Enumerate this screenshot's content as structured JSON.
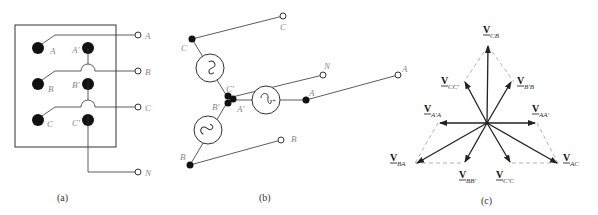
{
  "panel_a": {
    "caption": "(a)",
    "inner_labels": [
      "A",
      "A'",
      "B",
      "B'",
      "C",
      "C'"
    ],
    "terminal_labels": [
      "A",
      "B",
      "C",
      "N"
    ]
  },
  "panel_b": {
    "caption": "(b)",
    "node_labels": [
      "C",
      "C'",
      "B'",
      "A'",
      "A",
      "B"
    ],
    "terminal_labels": [
      "C",
      "N",
      "A",
      "B"
    ]
  },
  "panel_c": {
    "caption": "(c)",
    "phasors": [
      {
        "v": "V",
        "sub": "CB"
      },
      {
        "v": "V",
        "sub": "CC'"
      },
      {
        "v": "V",
        "sub": "B'B"
      },
      {
        "v": "V",
        "sub": "A'A"
      },
      {
        "v": "V",
        "sub": "AA'"
      },
      {
        "v": "V",
        "sub": "BA"
      },
      {
        "v": "V",
        "sub": "AC"
      },
      {
        "v": "V",
        "sub": "BB'"
      },
      {
        "v": "V",
        "sub": "C'C"
      }
    ]
  },
  "colors": {
    "line": "#222222",
    "dashed": "#aaaaaa",
    "label": "#888888"
  }
}
